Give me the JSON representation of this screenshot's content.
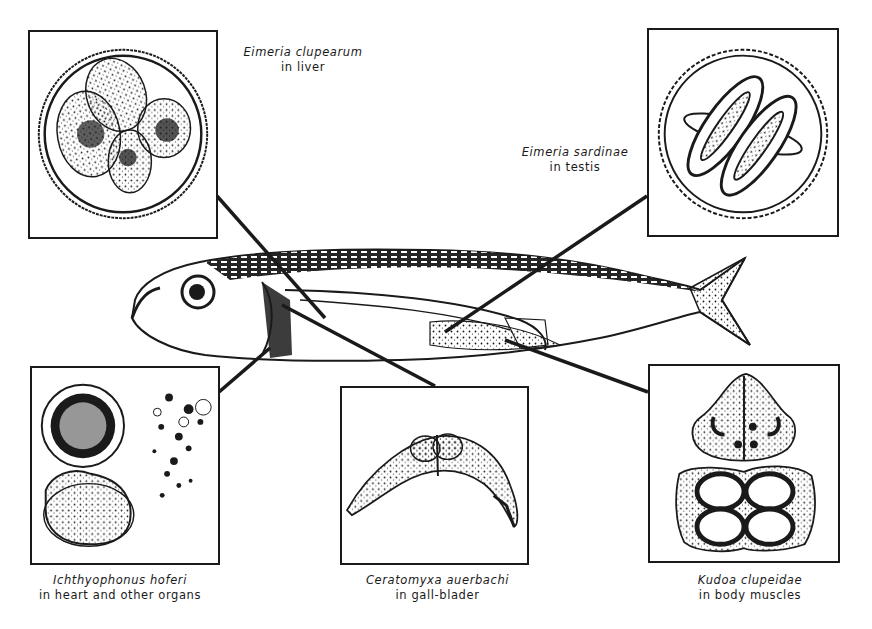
{
  "figure": {
    "colors": {
      "ink": "#1a1a1a",
      "background": "#ffffff"
    }
  },
  "panels": [
    {
      "id": "eimeria-clupearum",
      "species": "Eimeria clupearum",
      "location": "in liver"
    },
    {
      "id": "eimeria-sardinae",
      "species": "Eimeria sardinae",
      "location": "in testis"
    },
    {
      "id": "ichthyophonus-hoferi",
      "species": "Ichthyophonus hoferi",
      "location": "in heart and other organs"
    },
    {
      "id": "ceratomyxa-auerbachi",
      "species": "Ceratomyxa auerbachi",
      "location": "in gall-blader"
    },
    {
      "id": "kudoa-clupeidae",
      "species": "Kudoa clupeidae",
      "location": "in body muscles"
    }
  ]
}
